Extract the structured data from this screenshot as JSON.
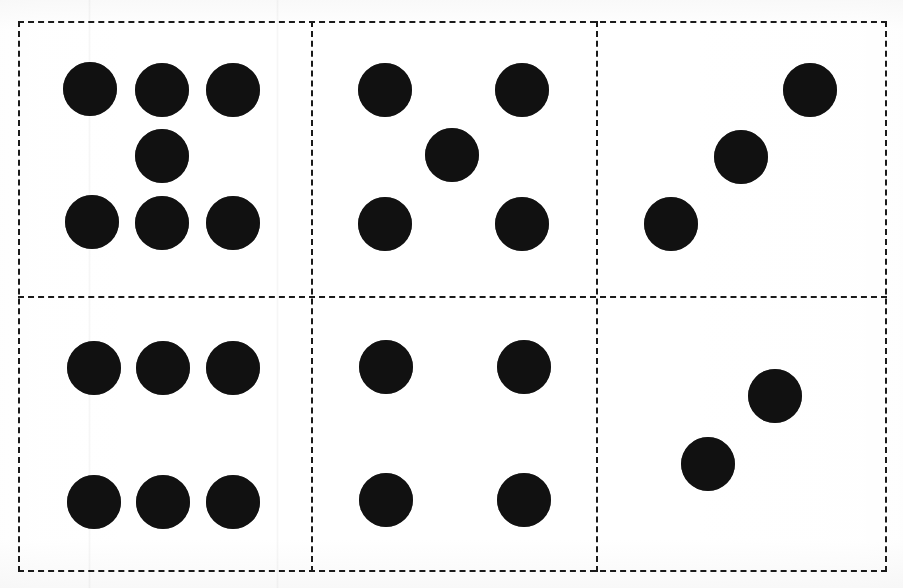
{
  "page": {
    "width": 903,
    "height": 588,
    "background_color": "#fefefe",
    "dot_color": "#111111",
    "line_color": "#1a1a1a"
  },
  "grid": {
    "rows": 2,
    "columns": 3,
    "border_style": "dashed",
    "frame": {
      "x": 18,
      "y": 21,
      "width": 869,
      "height": 551
    },
    "vertical_dividers": [
      311,
      596
    ],
    "horizontal_dividers": [
      296
    ]
  },
  "dot_diameter": 54,
  "cells": [
    {
      "name": "cell-top-left",
      "position": "top-left",
      "row": 1,
      "column": 1,
      "dot_count": 7,
      "arrangement": "three-one-three",
      "bounds": {
        "x": 18,
        "y": 21,
        "width": 293,
        "height": 275
      },
      "dots": [
        {
          "cx": 90,
          "cy": 89
        },
        {
          "cx": 162,
          "cy": 90
        },
        {
          "cx": 233,
          "cy": 90
        },
        {
          "cx": 162,
          "cy": 156
        },
        {
          "cx": 92,
          "cy": 222
        },
        {
          "cx": 162,
          "cy": 223
        },
        {
          "cx": 233,
          "cy": 223
        }
      ]
    },
    {
      "name": "cell-top-middle",
      "position": "top-middle",
      "row": 1,
      "column": 2,
      "dot_count": 5,
      "arrangement": "quincunx",
      "bounds": {
        "x": 311,
        "y": 21,
        "width": 285,
        "height": 275
      },
      "dots": [
        {
          "cx": 385,
          "cy": 90
        },
        {
          "cx": 522,
          "cy": 90
        },
        {
          "cx": 452,
          "cy": 155
        },
        {
          "cx": 385,
          "cy": 224
        },
        {
          "cx": 522,
          "cy": 224
        }
      ]
    },
    {
      "name": "cell-top-right",
      "position": "top-right",
      "row": 1,
      "column": 3,
      "dot_count": 3,
      "arrangement": "diagonal",
      "bounds": {
        "x": 596,
        "y": 21,
        "width": 291,
        "height": 275
      },
      "dots": [
        {
          "cx": 810,
          "cy": 90
        },
        {
          "cx": 741,
          "cy": 157
        },
        {
          "cx": 671,
          "cy": 224
        }
      ]
    },
    {
      "name": "cell-bottom-left",
      "position": "bottom-left",
      "row": 2,
      "column": 1,
      "dot_count": 6,
      "arrangement": "two-rows-of-three",
      "bounds": {
        "x": 18,
        "y": 296,
        "width": 293,
        "height": 276
      },
      "dots": [
        {
          "cx": 94,
          "cy": 368
        },
        {
          "cx": 163,
          "cy": 368
        },
        {
          "cx": 233,
          "cy": 368
        },
        {
          "cx": 94,
          "cy": 502
        },
        {
          "cx": 163,
          "cy": 502
        },
        {
          "cx": 233,
          "cy": 502
        }
      ]
    },
    {
      "name": "cell-bottom-middle",
      "position": "bottom-middle",
      "row": 2,
      "column": 2,
      "dot_count": 4,
      "arrangement": "four-corners",
      "bounds": {
        "x": 311,
        "y": 296,
        "width": 285,
        "height": 276
      },
      "dots": [
        {
          "cx": 386,
          "cy": 367
        },
        {
          "cx": 524,
          "cy": 367
        },
        {
          "cx": 386,
          "cy": 500
        },
        {
          "cx": 524,
          "cy": 500
        }
      ]
    },
    {
      "name": "cell-bottom-right",
      "position": "bottom-right",
      "row": 2,
      "column": 3,
      "dot_count": 2,
      "arrangement": "diagonal",
      "bounds": {
        "x": 596,
        "y": 296,
        "width": 291,
        "height": 276
      },
      "dots": [
        {
          "cx": 775,
          "cy": 396
        },
        {
          "cx": 708,
          "cy": 464
        }
      ]
    }
  ]
}
